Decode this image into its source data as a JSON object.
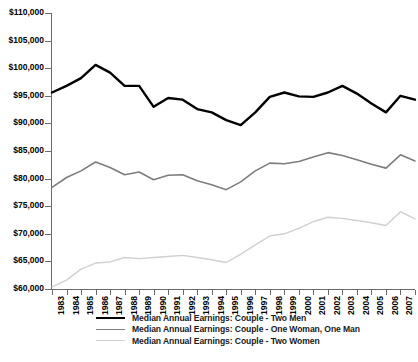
{
  "chart_data": {
    "type": "line",
    "title": "",
    "subtitle": "",
    "xlabel": "",
    "ylabel": "",
    "grid": false,
    "legend_position": "bottom",
    "ylim": [
      60000,
      110000
    ],
    "ytick_step": 5000,
    "ytick_labels": [
      "$110,000",
      "$105,000",
      "$100,000",
      "$95,000",
      "$90,000",
      "$85,000",
      "$80,000",
      "$75,000",
      "$70,000",
      "$65,000",
      "$60,000"
    ],
    "ytick_values": [
      110000,
      105000,
      100000,
      95000,
      90000,
      85000,
      80000,
      75000,
      70000,
      65000,
      60000
    ],
    "x": [
      1983,
      1984,
      1985,
      1986,
      1987,
      1988,
      1989,
      1990,
      1991,
      1992,
      1993,
      1994,
      1995,
      1996,
      1997,
      1998,
      1999,
      2000,
      2001,
      2002,
      2003,
      2004,
      2005,
      2006,
      2007,
      2008
    ],
    "xtick_labels": [
      "1983",
      "1984",
      "1985",
      "1986",
      "1987",
      "1988",
      "1989",
      "1990",
      "1991",
      "1992",
      "1993",
      "1994",
      "1995",
      "1996",
      "1997",
      "1998",
      "1999",
      "2000",
      "2001",
      "2002",
      "2003",
      "2004",
      "2005",
      "2006",
      "2007",
      "2008"
    ],
    "series": [
      {
        "name": "Median Annual Earnings: Couple - Two Men",
        "color": "#000000",
        "width": 2.4,
        "values": [
          95600,
          96800,
          98200,
          100600,
          99200,
          96800,
          96800,
          93000,
          94600,
          94300,
          92600,
          92000,
          90600,
          89700,
          92000,
          94800,
          95600,
          94900,
          94800,
          95600,
          96800,
          95400,
          93600,
          92000,
          95000,
          94300
        ]
      },
      {
        "name": "Median Annual Earnings: Couple - One Woman, One Man",
        "color": "#7d7d7d",
        "width": 1.6,
        "values": [
          78400,
          80200,
          81400,
          83000,
          82000,
          80700,
          81200,
          79800,
          80600,
          80700,
          79600,
          78900,
          78000,
          79400,
          81400,
          82800,
          82700,
          83100,
          83900,
          84700,
          84200,
          83400,
          82600,
          81900,
          84300,
          83200
        ]
      },
      {
        "name": "Median Annual Earnings: Couple - Two Women",
        "color": "#d0d0d0",
        "width": 1.4,
        "values": [
          60400,
          61600,
          63600,
          64700,
          64900,
          65700,
          65500,
          65700,
          65900,
          66100,
          65700,
          65300,
          64800,
          66300,
          68000,
          69600,
          70000,
          71000,
          72200,
          73000,
          72800,
          72400,
          72000,
          71500,
          74000,
          72700
        ]
      }
    ]
  },
  "legend": {
    "items": [
      {
        "label": "Median Annual Earnings: Couple - Two Men"
      },
      {
        "label": "Median Annual Earnings: Couple - One Woman, One Man"
      },
      {
        "label": "Median Annual Earnings: Couple - Two Women"
      }
    ]
  }
}
